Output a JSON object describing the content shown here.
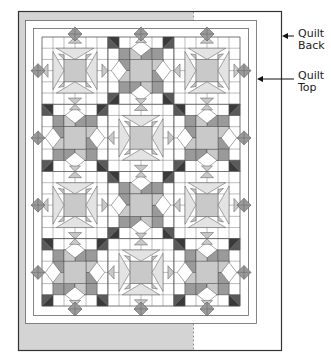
{
  "diagram": {
    "labels": [
      {
        "id": "quilt-back",
        "line1": "Quilt",
        "line2": "Back"
      },
      {
        "id": "quilt-top",
        "line1": "Quilt",
        "line2": "Top"
      }
    ],
    "layout": {
      "rows": 4,
      "cols": 3,
      "pattern": [
        [
          "star",
          "chain",
          "star"
        ],
        [
          "chain",
          "star",
          "chain"
        ],
        [
          "star",
          "chain",
          "star"
        ],
        [
          "chain",
          "star",
          "chain"
        ]
      ]
    },
    "colors": {
      "backing_grey": "#d4d4d4",
      "line": "#555555",
      "dark": "#3a3a3a",
      "medium": "#9a9a9a",
      "light": "#c9c9c9",
      "pale": "#e3e3e3",
      "white": "#ffffff"
    }
  }
}
